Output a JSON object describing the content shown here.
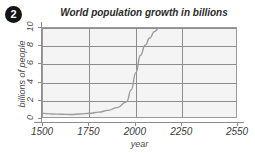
{
  "badge": {
    "label": "2"
  },
  "chart_data": {
    "type": "line",
    "title": "World population growth in billions",
    "xlabel": "year",
    "ylabel": "billions of people",
    "xlim": [
      1500,
      2550
    ],
    "ylim": [
      0,
      10
    ],
    "grid": true,
    "legend": "none",
    "line_color": "#9b9b9b",
    "grid_color": "#8d8d8d",
    "plot_bg": "#f4f4f4",
    "xticks": [
      1500,
      1750,
      2000,
      2250,
      2550
    ],
    "xtick_labels": [
      "1500",
      "1750",
      "2000",
      "2250",
      "2550"
    ],
    "yticks": [
      0,
      2,
      4,
      6,
      8,
      10
    ],
    "ytick_labels": [
      "0",
      "2",
      "4",
      "6",
      "8",
      "10"
    ],
    "series": [
      {
        "name": "world population",
        "x": [
          1500,
          1550,
          1600,
          1650,
          1700,
          1750,
          1800,
          1850,
          1900,
          1950,
          1975,
          2000,
          2025,
          2050,
          2075,
          2100,
          2125,
          2150
        ],
        "y": [
          0.62,
          0.55,
          0.52,
          0.5,
          0.55,
          0.63,
          0.75,
          0.95,
          1.25,
          1.9,
          3.2,
          5.1,
          7.0,
          8.1,
          8.9,
          9.6,
          10.0,
          10.4
        ]
      }
    ]
  }
}
